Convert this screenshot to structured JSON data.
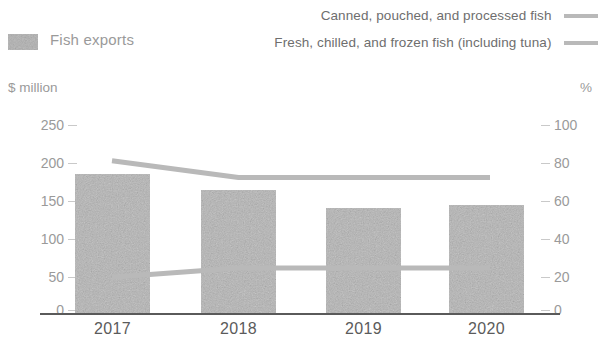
{
  "legend": {
    "bar_label": "Fish exports",
    "bar_swatch_icon": "patterned-gray-square",
    "line_items": [
      {
        "label": "Canned, pouched, and processed fish",
        "swatch_icon": "line-swatch",
        "color": "#b9b9b9"
      },
      {
        "label": "Fresh, chilled, and  frozen fish (including tuna)",
        "swatch_icon": "line-swatch",
        "color": "#b9b9b9"
      }
    ]
  },
  "axes": {
    "left_title": "$ million",
    "right_title": "%",
    "left_ticks": [
      "250",
      "200",
      "150",
      "100",
      "50",
      "0"
    ],
    "right_ticks": [
      "100",
      "80",
      "60",
      "40",
      "20",
      "0"
    ]
  },
  "chart_data": {
    "type": "bar",
    "title": "",
    "xlabel": "",
    "ylabel": "$ million",
    "y2label": "%",
    "categories": [
      "2017",
      "2018",
      "2019",
      "2020"
    ],
    "ylim": [
      0,
      250
    ],
    "y2lim": [
      0,
      100
    ],
    "grid": false,
    "legend_position": "top",
    "series": [
      {
        "name": "Fish exports",
        "type": "bar",
        "axis": "left",
        "unit": "$ million",
        "color": "#b5b5b5",
        "values": [
          185,
          164,
          140,
          144
        ]
      },
      {
        "name": "Canned, pouched, and processed fish",
        "type": "line",
        "axis": "right",
        "unit": "%",
        "color": "#b9b9b9",
        "values": [
          81,
          72,
          72,
          72
        ]
      },
      {
        "name": "Fresh, chilled, and  frozen fish (including tuna)",
        "type": "line",
        "axis": "right",
        "unit": "%",
        "color": "#b9b9b9",
        "values": [
          19,
          24,
          24,
          24
        ]
      }
    ]
  },
  "colors": {
    "bar_fill": "#b5b5b5",
    "line": "#b9b9b9",
    "axis_line": "#5a5a5a",
    "tick_text": "#9a9a9a",
    "category_text": "#5b5b5b"
  }
}
